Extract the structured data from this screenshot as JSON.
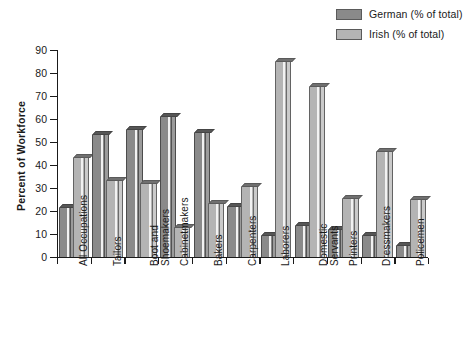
{
  "chart_data": {
    "type": "bar",
    "title": "",
    "xlabel": "",
    "ylabel": "Percent of Workforce",
    "ylim": [
      0,
      90
    ],
    "ytick_step": 10,
    "yticks": [
      "0",
      "10",
      "20",
      "30",
      "40",
      "50",
      "60",
      "70",
      "80",
      "90"
    ],
    "grid": false,
    "legend_position": "top-right",
    "categories": [
      "All Occupations",
      "Tailors",
      "Boot and\nShoemakers",
      "Cabinetmakers",
      "Bakers",
      "Carpenters",
      "Laborers",
      "Domestic\nServants",
      "Printers",
      "Dressmakers",
      "Policemen"
    ],
    "series": [
      {
        "name": "German (% of total)",
        "color": "#8a8a8a",
        "values": [
          21,
          53,
          55,
          61,
          54,
          21.5,
          9,
          13.5,
          11.5,
          9,
          4.5
        ]
      },
      {
        "name": "Irish (% of total)",
        "color": "#b4b4b4",
        "values": [
          43,
          33,
          31.5,
          12.5,
          23,
          30.5,
          85,
          74,
          25,
          45.5,
          24.5
        ]
      }
    ]
  },
  "legend": {
    "items": [
      {
        "label": "German (% of total)",
        "color": "#8a8a8a"
      },
      {
        "label": "Irish (% of total)",
        "color": "#b4b4b4"
      }
    ]
  }
}
